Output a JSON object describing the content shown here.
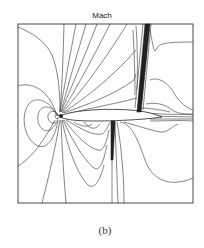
{
  "figure": {
    "title": "Mach",
    "caption": "(b)",
    "plot_type": "contour",
    "colors": {
      "line": "#333333",
      "background": "#ffffff"
    }
  }
}
